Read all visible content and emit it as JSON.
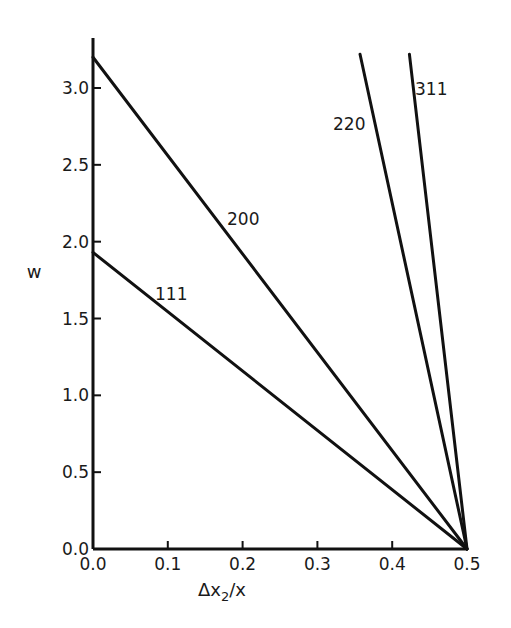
{
  "chart_data": {
    "type": "line",
    "title": "",
    "xlabel": "Δx2/x",
    "xlabel_main": "Δx",
    "xlabel_sub": "2",
    "xlabel_tail": "/x",
    "ylabel": "w",
    "xlim": [
      0.0,
      0.5
    ],
    "ylim": [
      0.0,
      3.3
    ],
    "grid": false,
    "legend": "none (inline labels)",
    "x_ticks": [
      "0.0",
      "0.1",
      "0.2",
      "0.3",
      "0.4",
      "0.5"
    ],
    "x_tick_values": [
      0.0,
      0.1,
      0.2,
      0.3,
      0.4,
      0.5
    ],
    "y_ticks": [
      "0.0",
      "0.5",
      "1.0",
      "1.5",
      "2.0",
      "2.5",
      "3.0"
    ],
    "y_tick_values": [
      0.0,
      0.5,
      1.0,
      1.5,
      2.0,
      2.5,
      3.0
    ],
    "series": [
      {
        "name": "111",
        "x": [
          0.0,
          0.5
        ],
        "y": [
          1.93,
          0.0
        ]
      },
      {
        "name": "200",
        "x": [
          0.0,
          0.5
        ],
        "y": [
          3.2,
          0.0
        ]
      },
      {
        "name": "220",
        "x": [
          0.357,
          0.5
        ],
        "y": [
          3.22,
          0.0
        ]
      },
      {
        "name": "311",
        "x": [
          0.423,
          0.5
        ],
        "y": [
          3.22,
          0.0
        ]
      }
    ],
    "color": "#111111"
  }
}
